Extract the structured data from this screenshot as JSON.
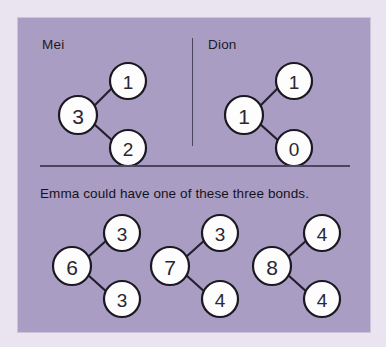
{
  "card": {
    "background_color": "#a99dc4",
    "page_background_color": "#e9e4f0"
  },
  "top_section": {
    "mei": {
      "label": "Mei",
      "whole": "3",
      "part_top": "1",
      "part_bottom": "2"
    },
    "dion": {
      "label": "Dion",
      "whole": "1",
      "part_top": "1",
      "part_bottom": "0"
    }
  },
  "bottom_section": {
    "instruction": "Emma could have one of these three bonds.",
    "bonds": [
      {
        "whole": "6",
        "part_top": "3",
        "part_bottom": "3"
      },
      {
        "whole": "7",
        "part_top": "3",
        "part_bottom": "4"
      },
      {
        "whole": "8",
        "part_top": "4",
        "part_bottom": "4"
      }
    ]
  }
}
